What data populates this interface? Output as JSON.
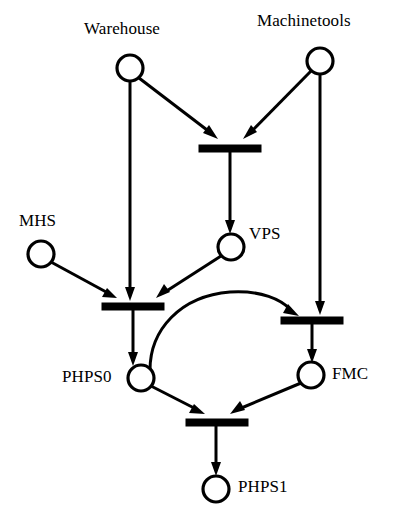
{
  "diagram": {
    "type": "petri-net",
    "colors": {
      "stroke": "#000000",
      "fill": "#ffffff",
      "background": "#ffffff",
      "transition": "#000000"
    },
    "places": [
      {
        "id": "warehouse",
        "label": "Warehouse",
        "cx": 130,
        "cy": 68,
        "r": 13,
        "tokens": 0
      },
      {
        "id": "machinetools",
        "label": "Machinetools",
        "cx": 320,
        "cy": 61,
        "r": 13,
        "tokens": 0
      },
      {
        "id": "mhs",
        "label": "MHS",
        "cx": 41,
        "cy": 254,
        "r": 13,
        "tokens": 0
      },
      {
        "id": "vps",
        "label": "VPS",
        "cx": 231,
        "cy": 247,
        "r": 13,
        "tokens": 0
      },
      {
        "id": "phps0",
        "label": "PHPS0",
        "cx": 141,
        "cy": 378,
        "r": 13,
        "tokens": 0
      },
      {
        "id": "fmc",
        "label": "FMC",
        "cx": 311,
        "cy": 375,
        "r": 13,
        "tokens": 0
      },
      {
        "id": "phps1",
        "label": "PHPS1",
        "cx": 216,
        "cy": 489,
        "r": 13,
        "tokens": 0
      }
    ],
    "transitions": [
      {
        "id": "t1",
        "label": "",
        "x": 199,
        "y": 145,
        "width": 62,
        "height": 7
      },
      {
        "id": "t2",
        "label": "",
        "x": 102,
        "y": 303,
        "width": 62,
        "height": 7
      },
      {
        "id": "t3",
        "label": "",
        "x": 281,
        "y": 317,
        "width": 62,
        "height": 7
      },
      {
        "id": "t4",
        "label": "",
        "x": 186,
        "y": 419,
        "width": 62,
        "height": 7
      }
    ],
    "arcs": [
      {
        "id": "a1",
        "from": "warehouse",
        "to": "t1",
        "shape": "line"
      },
      {
        "id": "a2",
        "from": "machinetools",
        "to": "t1",
        "shape": "line"
      },
      {
        "id": "a3",
        "from": "t1",
        "to": "vps",
        "shape": "line"
      },
      {
        "id": "a4",
        "from": "warehouse",
        "to": "t2",
        "shape": "line"
      },
      {
        "id": "a5",
        "from": "mhs",
        "to": "t2",
        "shape": "line"
      },
      {
        "id": "a6",
        "from": "vps",
        "to": "t2",
        "shape": "line"
      },
      {
        "id": "a7",
        "from": "t2",
        "to": "phps0",
        "shape": "line"
      },
      {
        "id": "a8",
        "from": "machinetools",
        "to": "t3",
        "shape": "line"
      },
      {
        "id": "a9",
        "from": "phps0",
        "to": "t3",
        "shape": "curve"
      },
      {
        "id": "a10",
        "from": "t3",
        "to": "fmc",
        "shape": "line"
      },
      {
        "id": "a11",
        "from": "phps0",
        "to": "t4",
        "shape": "line"
      },
      {
        "id": "a12",
        "from": "fmc",
        "to": "t4",
        "shape": "line"
      },
      {
        "id": "a13",
        "from": "t4",
        "to": "phps1",
        "shape": "line"
      }
    ]
  }
}
